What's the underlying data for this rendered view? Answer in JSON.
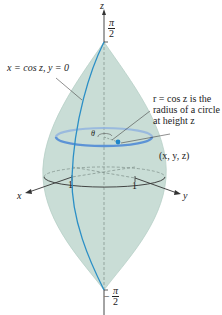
{
  "figure": {
    "type": "3d-surface-of-revolution",
    "colors": {
      "surface": "#c9ddd6",
      "surface_edge": "#b6cfc7",
      "curve_blue": "#2b8fc6",
      "circle_blue": "#5c93d6",
      "axis": "#333333",
      "dashed": "#7b8c87"
    },
    "axes": {
      "z_label": "z",
      "x_label": "x",
      "y_label": "y",
      "tick_x": "1",
      "tick_y": "1"
    },
    "top_label": {
      "num": "π",
      "den": "2",
      "sign": ""
    },
    "bottom_label": {
      "num": "π",
      "den": "2",
      "sign": "−"
    },
    "annotations": {
      "curve": "x = cos z, y = 0",
      "radius_line1": "r = cos z is the",
      "radius_line2": "radius of a circle",
      "radius_line3": "at height z",
      "point": "(x, y, z)",
      "theta": "θ"
    }
  }
}
